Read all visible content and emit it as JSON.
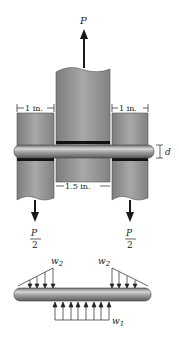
{
  "figure": {
    "load_top": "P",
    "dim_left": "1 in.",
    "dim_right": "1 in.",
    "dim_middle": "1.5 in.",
    "dim_pin": "d",
    "left_reaction": {
      "num": "P",
      "den": "2"
    },
    "right_reaction": {
      "num": "P",
      "den": "2"
    },
    "load_w2_left": "w",
    "load_w2_left_sub": "2",
    "load_w2_right": "w",
    "load_w2_right_sub": "2",
    "load_w1": "w",
    "load_w1_sub": "1"
  },
  "colors": {
    "plate": "#8a8a8a",
    "plate_light": "#b4b4b4",
    "pin": "#9a9a9a",
    "arrow": "#1a1a1a"
  }
}
